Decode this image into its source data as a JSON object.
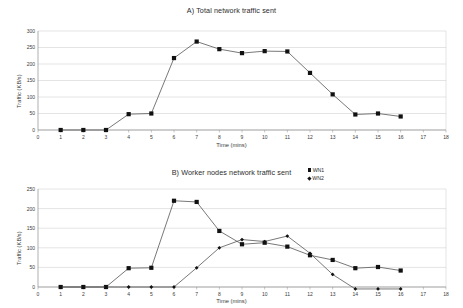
{
  "chart_data": [
    {
      "id": "A",
      "type": "line",
      "title": "A) Total network traffic sent",
      "xlabel": "Time (mins)",
      "ylabel": "Traffic (KB/s)",
      "grid": true,
      "legend": null,
      "xlim": [
        0,
        18
      ],
      "ylim": [
        0,
        300
      ],
      "xticks": [
        0,
        1,
        2,
        3,
        4,
        5,
        6,
        7,
        8,
        9,
        10,
        11,
        12,
        13,
        14,
        15,
        16,
        17,
        18
      ],
      "yticks": [
        0,
        50,
        100,
        150,
        200,
        250,
        300
      ],
      "x": [
        1,
        2,
        3,
        4,
        5,
        6,
        7,
        8,
        9,
        10,
        11,
        12,
        13,
        14,
        15,
        16
      ],
      "series": [
        {
          "name": "Total",
          "marker": "square",
          "values": [
            0,
            0,
            0,
            48,
            50,
            218,
            268,
            245,
            233,
            239,
            238,
            173,
            108,
            47,
            50,
            41
          ]
        }
      ]
    },
    {
      "id": "B",
      "type": "line",
      "title": "B) Worker nodes network traffic sent",
      "xlabel": "Time (mins)",
      "ylabel": "Traffic (KB/s)",
      "grid": true,
      "legend_position": "top-right",
      "xlim": [
        0,
        18
      ],
      "ylim": [
        0,
        250
      ],
      "xticks": [
        0,
        1,
        2,
        3,
        4,
        5,
        6,
        7,
        8,
        9,
        10,
        11,
        12,
        13,
        14,
        15,
        16,
        17,
        18
      ],
      "yticks": [
        0,
        50,
        100,
        150,
        200,
        250
      ],
      "x": [
        1,
        2,
        3,
        4,
        5,
        6,
        7,
        8,
        9,
        10,
        11,
        12,
        13,
        14,
        15,
        16
      ],
      "series": [
        {
          "name": "WN1",
          "marker": "square",
          "values": [
            0,
            0,
            0,
            48,
            49,
            220,
            217,
            143,
            109,
            113,
            103,
            81,
            69,
            48,
            51,
            42
          ]
        },
        {
          "name": "WN2",
          "marker": "diamond",
          "values": [
            0,
            0,
            0,
            0,
            0,
            0,
            49,
            100,
            121,
            116,
            130,
            86,
            32,
            -5,
            -5,
            -5
          ]
        }
      ]
    }
  ],
  "colors": {
    "series_line": "#555555",
    "marker": "#111111",
    "grid": "#c8c8c8",
    "axis": "#8c8c8c",
    "text": "#2b2b2b",
    "background": "#ffffff"
  }
}
